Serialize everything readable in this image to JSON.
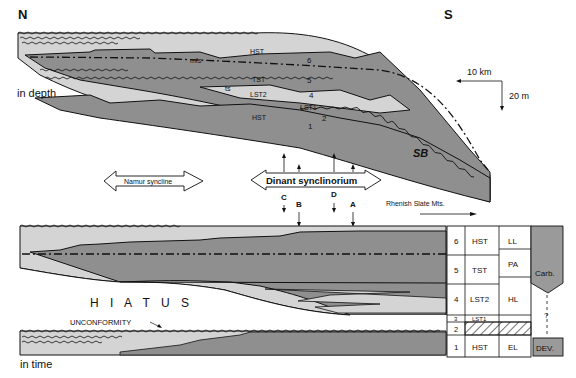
{
  "top_section": {
    "north_label": "N",
    "south_label": "S",
    "mode_label": "in depth",
    "scale_horizontal": "10 km",
    "scale_vertical": "20 m",
    "systems_tracts": {
      "hst_upper": "HST",
      "tst": "TST",
      "lst2": "LST2",
      "lst1": "LST1",
      "hst_lower": "HST"
    },
    "surfaces": {
      "mfs": "mfs",
      "ts": "ts",
      "sb": "SB"
    },
    "unit_numbers": [
      "6",
      "5",
      "4",
      "3",
      "2",
      "1"
    ]
  },
  "middle_section": {
    "namur_label": "Namur syncline",
    "dinant_label": "Dinant synclinorium",
    "rhenish_label": "Rhenish Slate Mts.",
    "sections": [
      "C",
      "B",
      "D",
      "A"
    ]
  },
  "bottom_section": {
    "mode_label": "in time",
    "hiatus_label": "H I A T U S",
    "unconformity_label": "UNCONFORMITY",
    "table": [
      {
        "unit": "6",
        "tract": "HST",
        "stage": "LL"
      },
      {
        "unit": "5",
        "tract": "TST",
        "stage": "PA"
      },
      {
        "unit": "4",
        "tract": "LST2",
        "stage": "HL"
      },
      {
        "unit": "3",
        "tract": "LST1",
        "stage": ""
      },
      {
        "unit": "2",
        "tract": "",
        "stage": ""
      },
      {
        "unit": "1",
        "tract": "HST",
        "stage": "EL"
      }
    ],
    "periods": {
      "carb": "Carb.",
      "dev": "DEV.",
      "uncertain": "?"
    }
  },
  "colors": {
    "dark_fill": "#8e8e8e",
    "light_fill": "#cfcfcf",
    "line": "#111111",
    "background": "#ffffff"
  }
}
